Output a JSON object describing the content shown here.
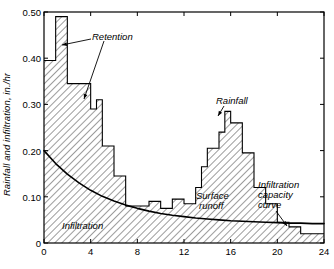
{
  "chart_data": {
    "type": "area",
    "title": "",
    "xlabel": "",
    "ylabel": "Rainfall and infiltration, in./hr",
    "xlim": [
      0,
      24
    ],
    "ylim": [
      0,
      0.5
    ],
    "xticks": [
      "0",
      "4",
      "8",
      "12",
      "16",
      "20",
      "24"
    ],
    "xtick_values": [
      0,
      4,
      8,
      12,
      16,
      20,
      24
    ],
    "yticks": [
      "0",
      "0.10",
      "0.20",
      "0.30",
      "0.40",
      "0.50"
    ],
    "ytick_values": [
      0,
      0.1,
      0.2,
      0.3,
      0.4,
      0.5
    ],
    "grid": false,
    "legend": "none",
    "series": [
      {
        "name": "Rainfall hyetograph",
        "type": "step",
        "x_edges": [
          0,
          1,
          2,
          3,
          4,
          4.5,
          5,
          6,
          7,
          8,
          9,
          10,
          10.5,
          11,
          12,
          13,
          13.5,
          14,
          15,
          15.5,
          16,
          17,
          18,
          19,
          20,
          21,
          22,
          23,
          24
        ],
        "values": [
          0.395,
          0.49,
          0.345,
          0.345,
          0.29,
          0.31,
          0.21,
          0.145,
          0.08,
          0.08,
          0.09,
          0.075,
          0.075,
          0.095,
          0.085,
          0.12,
          0.165,
          0.205,
          0.24,
          0.285,
          0.26,
          0.195,
          0.12,
          0.085,
          0.045,
          0.035,
          0.02,
          0.02
        ]
      },
      {
        "name": "Infiltration capacity curve",
        "type": "line",
        "x": [
          0,
          1,
          2,
          3,
          4,
          5,
          6,
          7,
          8,
          9,
          10,
          11,
          12,
          13,
          14,
          15,
          16,
          17,
          18,
          19,
          20,
          21,
          22,
          23,
          24
        ],
        "values": [
          0.2,
          0.172,
          0.149,
          0.13,
          0.114,
          0.101,
          0.091,
          0.082,
          0.075,
          0.069,
          0.064,
          0.06,
          0.057,
          0.054,
          0.052,
          0.05,
          0.048,
          0.047,
          0.046,
          0.045,
          0.044,
          0.043,
          0.043,
          0.042,
          0.042
        ]
      }
    ],
    "annotations": [
      {
        "name": "retention",
        "text": "Retention"
      },
      {
        "name": "rainfall",
        "text": "Rainfall"
      },
      {
        "name": "surface-runoff",
        "text": "Surface\nrunoff"
      },
      {
        "name": "infiltration-capacity-curve",
        "text": "Infiltration\ncapacity\ncurve"
      },
      {
        "name": "infiltration",
        "text": "Infiltration"
      }
    ]
  },
  "axis": {
    "ylabel": "Rainfall and infiltration, in./hr",
    "yticks": {
      "t0": "0",
      "t1": "0.10",
      "t2": "0.20",
      "t3": "0.30",
      "t4": "0.40",
      "t5": "0.50"
    },
    "xticks": {
      "t0": "0",
      "t1": "4",
      "t2": "8",
      "t3": "12",
      "t4": "16",
      "t5": "20",
      "t6": "24"
    }
  },
  "labels": {
    "retention": "Retention",
    "rainfall": "Rainfall",
    "surface_runoff_1": "Surface",
    "surface_runoff_2": "runoff",
    "infil_cap_1": "Infiltration",
    "infil_cap_2": "capacity",
    "infil_cap_3": "curve",
    "infiltration": "Infiltration"
  },
  "colors": {
    "ink": "#000000",
    "hatch": "#1a1a1a",
    "background": "#ffffff"
  }
}
